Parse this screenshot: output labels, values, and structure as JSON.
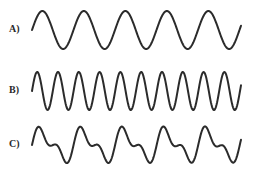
{
  "panels": [
    {
      "label": "A)",
      "description": "single sine wave, lower frequency"
    },
    {
      "label": "B)",
      "description": "single sine wave, higher frequency (double of A)"
    },
    {
      "label": "C)",
      "description": "composite wave = sum of A and B"
    }
  ],
  "chart_data": {
    "type": "line",
    "title": "",
    "series": [
      {
        "name": "A)",
        "x_start": 32,
        "x_end": 241,
        "midline_y": 30,
        "components": [
          {
            "amplitude": 19,
            "period_px": 41.5,
            "phase_px": 0
          }
        ],
        "cycles": 5
      },
      {
        "name": "B)",
        "x_start": 32,
        "x_end": 241,
        "midline_y": 91,
        "components": [
          {
            "amplitude": 19,
            "period_px": 20.8,
            "phase_px": 0
          }
        ],
        "cycles": 10
      },
      {
        "name": "C)",
        "x_start": 32,
        "x_end": 241,
        "midline_y": 145,
        "components": [
          {
            "amplitude": 13,
            "period_px": 41.5,
            "phase_px": 0
          },
          {
            "amplitude": 8,
            "period_px": 20.8,
            "phase_px": 0
          }
        ],
        "cycles": 5
      }
    ],
    "colors": {
      "stroke": "#2b2b2b",
      "background": "#ffffff"
    }
  }
}
